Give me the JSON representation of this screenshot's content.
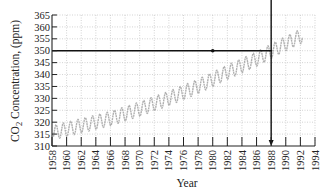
{
  "chart_data": {
    "type": "line",
    "title": "",
    "xlabel": "Year",
    "ylabel": "CO2 Concentration, (ppm)",
    "ylabel_parts": {
      "main": "CO",
      "sub": "2",
      "rest": " Concentration, (ppm)"
    },
    "xlim": [
      1958,
      1994
    ],
    "ylim": [
      310,
      365
    ],
    "grid": true,
    "grid_style": "dotted",
    "legend": null,
    "x_ticks": [
      "1958",
      "1960",
      "1962",
      "1964",
      "1966",
      "1968",
      "1970",
      "1972",
      "1974",
      "1976",
      "1978",
      "1980",
      "1982",
      "1984",
      "1986",
      "1988",
      "1990",
      "1992",
      "1994"
    ],
    "y_ticks": [
      "310",
      "315",
      "320",
      "325",
      "330",
      "335",
      "340",
      "345",
      "350",
      "355",
      "360",
      "365"
    ],
    "series": [
      {
        "name": "CO2 concentration (monthly, seasonal cycle)",
        "color": "#b0b0b0",
        "x_start": 1958.2,
        "x_end": 1992.3,
        "trend": [
          {
            "x": 1958,
            "y": 315.5
          },
          {
            "x": 1962,
            "y": 318.5
          },
          {
            "x": 1966,
            "y": 321.5
          },
          {
            "x": 1970,
            "y": 325.5
          },
          {
            "x": 1974,
            "y": 330.0
          },
          {
            "x": 1978,
            "y": 335.0
          },
          {
            "x": 1982,
            "y": 341.0
          },
          {
            "x": 1986,
            "y": 346.5
          },
          {
            "x": 1990,
            "y": 353.0
          },
          {
            "x": 1992,
            "y": 356.0
          }
        ],
        "seasonal_amplitude": 3.0
      }
    ],
    "annotations": [
      {
        "type": "hline",
        "y": 350,
        "x_from": 1958,
        "x_to": 1988,
        "color": "#111111"
      },
      {
        "type": "vline-arrow",
        "x": 1988,
        "y_from": 350,
        "y_to": 310,
        "color": "#111111"
      },
      {
        "type": "point",
        "x": 1980,
        "y": 350,
        "color": "#111111"
      }
    ]
  }
}
